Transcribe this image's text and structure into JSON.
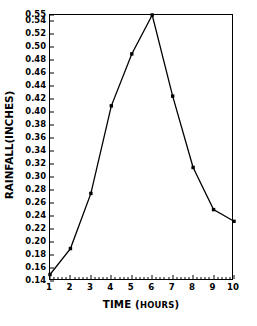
{
  "chart_data": {
    "type": "line",
    "title": "",
    "xlabel": "TIME (HOURS)",
    "xlabel_main": "TIME (",
    "xlabel_unit": "HOURS",
    "xlabel_close": ")",
    "ylabel": "RAINFALL(INCHES)",
    "x": [
      1,
      2,
      3,
      4,
      5,
      6,
      7,
      8,
      9,
      10
    ],
    "values": [
      0.15,
      0.19,
      0.275,
      0.41,
      0.49,
      0.55,
      0.425,
      0.315,
      0.25,
      0.232
    ],
    "xlim": [
      1,
      10
    ],
    "ylim": [
      0.14,
      0.55
    ],
    "xticks": [
      "1",
      "2",
      "3",
      "4",
      "5",
      "6",
      "7",
      "8",
      "9",
      "10"
    ],
    "yticks": [
      "0.14",
      "0.16",
      "0.18",
      "0.20",
      "0.22",
      "0.24",
      "0.26",
      "0.28",
      "0.30",
      "0.32",
      "0.34",
      "0.36",
      "0.38",
      "0.40",
      "0.42",
      "0.44",
      "0.46",
      "0.48",
      "0.50",
      "0.52",
      "0.54",
      "0.55"
    ],
    "ytick_values": [
      0.14,
      0.16,
      0.18,
      0.2,
      0.22,
      0.24,
      0.26,
      0.28,
      0.3,
      0.32,
      0.34,
      0.36,
      0.38,
      0.4,
      0.42,
      0.44,
      0.46,
      0.48,
      0.5,
      0.52,
      0.54,
      0.55
    ],
    "grid": false,
    "legend": false,
    "marker": "square",
    "line_color": "#000000",
    "marker_color": "#000000",
    "background_color": "#ffffff",
    "frame_color": "#000000"
  }
}
